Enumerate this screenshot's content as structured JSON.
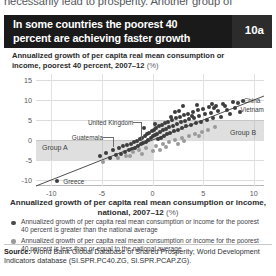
{
  "page": {
    "cutoff_body_text": "necessarily lead to prosperity. Another group of"
  },
  "header": {
    "title": "In some countries the poorest 40 percent are achieving faster growth",
    "figure_number": "10a"
  },
  "source": {
    "label": "Source:",
    "text": " World Bank Global Database of Shared Prosperity; World Development Indicators database (SI.SPR.PC40.ZG, SI.SPR.PCAP.ZG)."
  },
  "legend": {
    "items": [
      {
        "marker": "dark-dot",
        "text": "Annualized growth of per capita real mean consumption or income for the poorest 40 percent is greater than the national average"
      },
      {
        "marker": "light-dot",
        "text": "Annualized growth of per capita real mean consumption or income for the poorest 40 percent is less than or equal to the national average"
      }
    ]
  },
  "chart_data": {
    "type": "scatter",
    "title": "In some countries the poorest 40 percent are achieving faster growth",
    "ylabel": "Annualized growth of per capita real mean consumption or income, poorest 40 percent, 2007–12",
    "ylabel_unit": "(%)",
    "xlabel": "Annualized growth of per capita real mean consumption or income, national, 2007–12",
    "xlabel_unit": "(%)",
    "xlim": [
      -11.5,
      11.0
    ],
    "ylim": [
      -11.5,
      16.5
    ],
    "xticks": [
      -10,
      -5,
      0,
      5,
      10
    ],
    "yticks": [
      -10,
      -5,
      0,
      5,
      10,
      15
    ],
    "grid": true,
    "legend_position": "below",
    "reference_line": {
      "label": "45-degree equality line",
      "from": [
        -11.5,
        -11.5
      ],
      "to": [
        11.0,
        11.0
      ]
    },
    "bands": [
      {
        "name": "Group A",
        "label": "Group A",
        "x_from": -11.5,
        "x_to": 0,
        "y_from": -5,
        "y_to": 0
      },
      {
        "name": "Group B",
        "label": "Group B",
        "x_from": 0,
        "x_to": 11.0,
        "y_from": 0,
        "y_to": 5
      }
    ],
    "annotations": [
      {
        "label": "Greece",
        "x": -9.4,
        "y": -10.2
      },
      {
        "label": "Guatemala",
        "x": -3.9,
        "y": -2.4
      },
      {
        "label": "United Kingdom",
        "x": -1.1,
        "y": -1.1
      },
      {
        "label": "China",
        "x": 8.4,
        "y": 9.3
      },
      {
        "label": "Vietnam",
        "x": 8.1,
        "y": 8.1
      }
    ],
    "series": [
      {
        "name": "Poorest 40 percent growth greater than national average",
        "marker": "dark-dot",
        "points": [
          [
            -9.4,
            -10.2
          ],
          [
            -5.2,
            -4.1
          ],
          [
            -4.6,
            -3.3
          ],
          [
            -4.2,
            -4.6
          ],
          [
            -3.9,
            -2.4
          ],
          [
            -3.6,
            -3.8
          ],
          [
            -3.3,
            -2.0
          ],
          [
            -3.1,
            -3.5
          ],
          [
            -2.9,
            -1.6
          ],
          [
            -2.7,
            -2.9
          ],
          [
            -2.5,
            -1.2
          ],
          [
            -2.3,
            -2.6
          ],
          [
            -2.1,
            -0.9
          ],
          [
            -2.0,
            -2.2
          ],
          [
            -1.8,
            -0.6
          ],
          [
            -1.7,
            -1.9
          ],
          [
            -1.5,
            -0.2
          ],
          [
            -1.4,
            -1.6
          ],
          [
            -1.2,
            0.3
          ],
          [
            -1.1,
            -1.1
          ],
          [
            -1.0,
            0.6
          ],
          [
            -0.9,
            -0.8
          ],
          [
            -0.7,
            1.0
          ],
          [
            -0.6,
            -0.4
          ],
          [
            -0.5,
            1.4
          ],
          [
            -0.4,
            0.1
          ],
          [
            -0.3,
            1.8
          ],
          [
            -0.2,
            0.5
          ],
          [
            -0.1,
            2.2
          ],
          [
            0.0,
            0.9
          ],
          [
            0.1,
            2.6
          ],
          [
            0.2,
            1.2
          ],
          [
            0.3,
            3.0
          ],
          [
            0.4,
            1.6
          ],
          [
            0.5,
            0.2
          ],
          [
            0.6,
            3.4
          ],
          [
            0.7,
            2.0
          ],
          [
            0.8,
            0.6
          ],
          [
            0.9,
            3.8
          ],
          [
            1.0,
            2.4
          ],
          [
            1.1,
            1.0
          ],
          [
            1.2,
            4.2
          ],
          [
            1.3,
            2.8
          ],
          [
            1.4,
            1.4
          ],
          [
            1.5,
            4.6
          ],
          [
            1.6,
            3.2
          ],
          [
            1.7,
            1.8
          ],
          [
            1.9,
            5.0
          ],
          [
            2.0,
            3.6
          ],
          [
            2.1,
            2.2
          ],
          [
            2.3,
            5.4
          ],
          [
            2.4,
            4.0
          ],
          [
            2.5,
            2.6
          ],
          [
            2.7,
            5.8
          ],
          [
            2.8,
            4.4
          ],
          [
            2.9,
            3.0
          ],
          [
            3.1,
            6.2
          ],
          [
            3.2,
            4.8
          ],
          [
            3.3,
            3.4
          ],
          [
            3.5,
            6.6
          ],
          [
            3.6,
            5.2
          ],
          [
            3.8,
            3.8
          ],
          [
            4.0,
            7.0
          ],
          [
            4.1,
            5.6
          ],
          [
            4.3,
            4.2
          ],
          [
            4.5,
            7.4
          ],
          [
            4.6,
            6.0
          ],
          [
            4.8,
            4.6
          ],
          [
            5.0,
            7.8
          ],
          [
            5.2,
            6.4
          ],
          [
            5.4,
            5.0
          ],
          [
            5.6,
            8.2
          ],
          [
            5.8,
            6.8
          ],
          [
            6.0,
            5.4
          ],
          [
            6.3,
            8.6
          ],
          [
            6.5,
            7.2
          ],
          [
            6.8,
            5.8
          ],
          [
            7.0,
            9.0
          ],
          [
            7.3,
            7.6
          ],
          [
            7.6,
            6.4
          ],
          [
            7.9,
            9.4
          ],
          [
            8.1,
            8.1
          ],
          [
            8.4,
            9.3
          ],
          [
            8.6,
            7.0
          ],
          [
            8.9,
            9.8
          ],
          [
            3.0,
            8.4
          ],
          [
            4.4,
            8.8
          ],
          [
            2.2,
            6.9
          ],
          [
            5.9,
            9.1
          ],
          [
            1.8,
            5.7
          ],
          [
            0.2,
            3.9
          ],
          [
            -0.8,
            2.9
          ],
          [
            6.1,
            7.9
          ],
          [
            7.2,
            8.4
          ],
          [
            2.6,
            7.2
          ],
          [
            3.9,
            6.1
          ]
        ]
      },
      {
        "name": "Poorest 40 percent growth less than or equal to national average",
        "marker": "light-dot",
        "points": [
          [
            -4.9,
            -5.6
          ],
          [
            -3.4,
            -4.4
          ],
          [
            -2.6,
            -3.9
          ],
          [
            -1.9,
            -3.1
          ],
          [
            -1.3,
            -2.6
          ],
          [
            -0.6,
            -2.1
          ],
          [
            0.3,
            -1.5
          ],
          [
            1.0,
            -1.0
          ],
          [
            1.6,
            -0.5
          ],
          [
            2.2,
            -0.1
          ],
          [
            2.9,
            0.4
          ],
          [
            3.6,
            0.9
          ],
          [
            4.2,
            1.5
          ],
          [
            4.9,
            2.0
          ],
          [
            5.5,
            2.6
          ],
          [
            6.2,
            3.2
          ],
          [
            0.0,
            -2.8
          ],
          [
            -1.0,
            -3.4
          ],
          [
            2.5,
            -0.9
          ],
          [
            1.3,
            -1.8
          ],
          [
            3.1,
            -0.3
          ],
          [
            0.7,
            -2.4
          ],
          [
            -2.2,
            -4.0
          ],
          [
            4.6,
            1.0
          ]
        ]
      }
    ]
  }
}
